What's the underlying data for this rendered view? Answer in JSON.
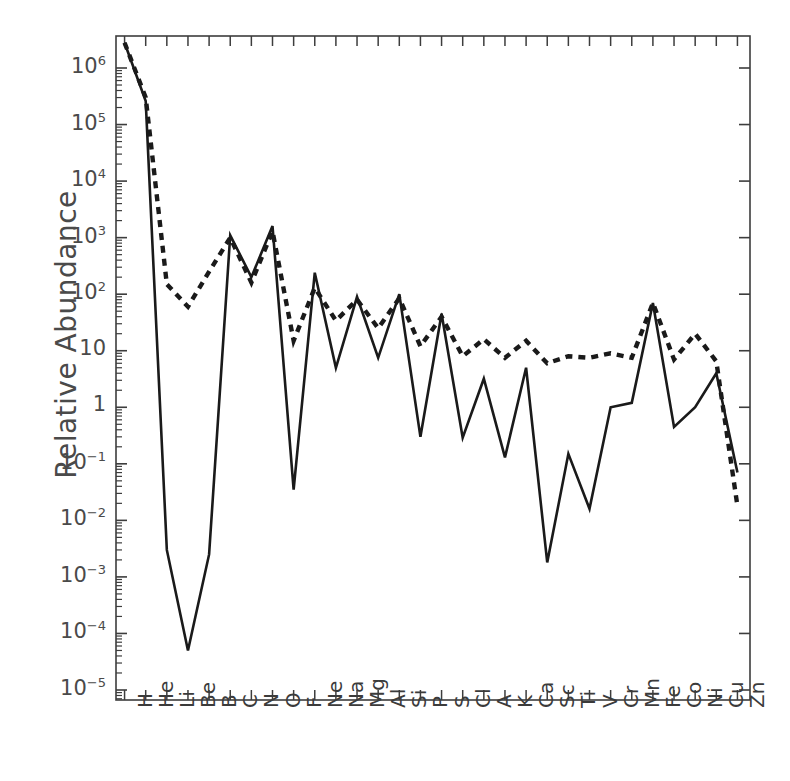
{
  "chart_data": {
    "type": "line",
    "title": "",
    "xlabel": "",
    "ylabel": "Relative Abundance",
    "categories": [
      "H",
      "He",
      "Li",
      "Be",
      "B",
      "C",
      "N",
      "O",
      "F",
      "Ne",
      "Na",
      "Mg",
      "Al",
      "Si",
      "P",
      "S",
      "Cl",
      "A",
      "K",
      "Ca",
      "Sc",
      "Ti",
      "V",
      "Cr",
      "Mn",
      "Fe",
      "Co",
      "Ni",
      "Cu",
      "Zn"
    ],
    "ylim": [
      1e-05,
      4000000.0
    ],
    "yticks": [
      1000000.0,
      100000.0,
      10000.0,
      1000.0,
      100.0,
      10,
      1,
      0.1,
      0.01,
      0.001,
      0.0001,
      1e-05
    ],
    "ytick_labels": [
      "10^6",
      "10^5",
      "10^4",
      "10^3",
      "10^2",
      "10",
      "1",
      "10^-1",
      "10^-2",
      "10^-3",
      "10^-4",
      "10^-5"
    ],
    "yscale": "log",
    "grid": false,
    "legend": "none",
    "series": [
      {
        "name": "solid",
        "style": "solid",
        "color": "#1a1a1a",
        "values": [
          2800000.0,
          260000.0,
          0.003,
          5e-05,
          0.0025,
          1100.0,
          200.0,
          1600.0,
          0.035,
          240.0,
          5.0,
          90.0,
          7.5,
          100.0,
          0.3,
          45.0,
          0.29,
          3.2,
          0.13,
          5.0,
          0.0018,
          0.15,
          0.016,
          1.0,
          1.2,
          70.0,
          0.45,
          1.0,
          4.0,
          0.07
        ]
      },
      {
        "name": "dotted",
        "style": "dotted",
        "color": "#1a1a1a",
        "values": [
          2800000.0,
          300000.0,
          150.0,
          60.0,
          250.0,
          1000.0,
          160.0,
          1300.0,
          15.0,
          130.0,
          34.0,
          80.0,
          25.0,
          85.0,
          12.0,
          40.0,
          8.0,
          16.0,
          7.5,
          15.0,
          6.0,
          8.0,
          7.5,
          9.0,
          7.5,
          70.0,
          7.0,
          20.0,
          6.5,
          0.018
        ]
      }
    ]
  },
  "axes": {
    "ylabel_text": "Relative Abundance",
    "ytick_display": [
      {
        "mantissa": "10",
        "exp": "6"
      },
      {
        "mantissa": "10",
        "exp": "5"
      },
      {
        "mantissa": "10",
        "exp": "4"
      },
      {
        "mantissa": "10",
        "exp": "3"
      },
      {
        "mantissa": "10",
        "exp": "2"
      },
      {
        "mantissa": "10",
        "exp": ""
      },
      {
        "mantissa": "1",
        "exp": ""
      },
      {
        "mantissa": "10",
        "exp": "−1"
      },
      {
        "mantissa": "10",
        "exp": "−2"
      },
      {
        "mantissa": "10",
        "exp": "−3"
      },
      {
        "mantissa": "10",
        "exp": "−4"
      },
      {
        "mantissa": "10",
        "exp": "−5"
      }
    ]
  },
  "colors": {
    "axis": "#3d3d3d",
    "curve": "#1a1a1a",
    "text": "#4a4a4a",
    "background": "#ffffff"
  }
}
